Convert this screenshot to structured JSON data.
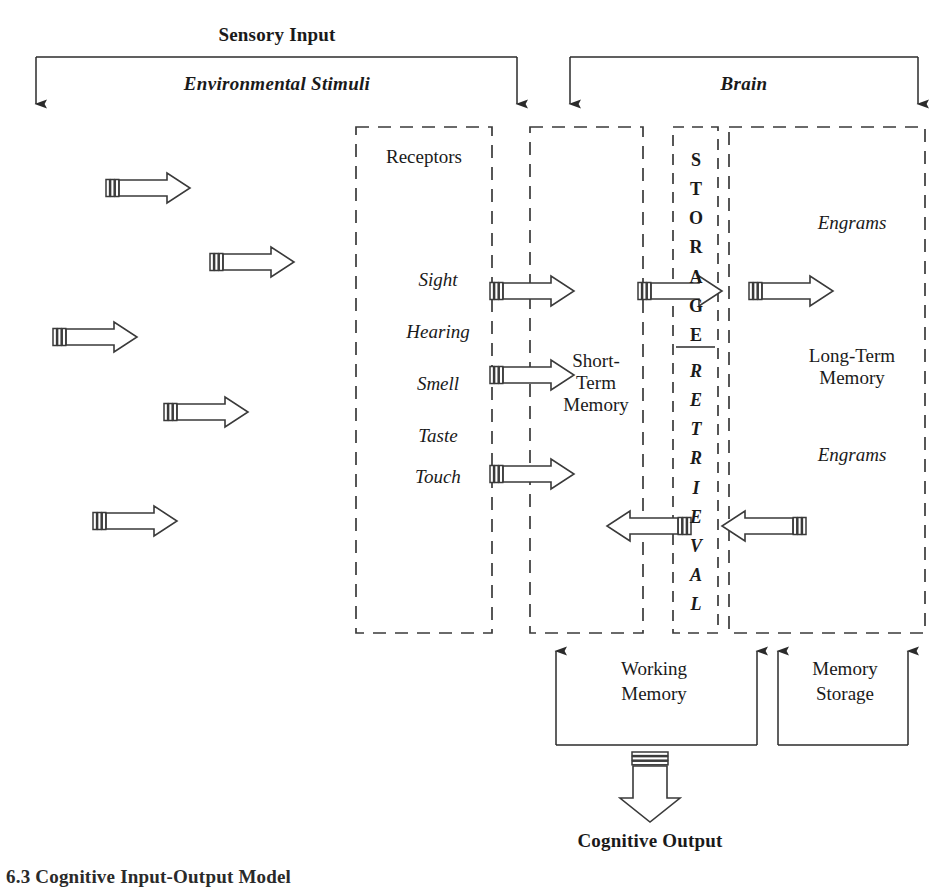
{
  "diagram": {
    "title_top": "Sensory Input",
    "caption": "6.3  Cognitive Input-Output Model",
    "groups": [
      {
        "label": "Environmental Stimuli"
      },
      {
        "label": "Brain"
      }
    ],
    "boxes": {
      "receptors": {
        "title": "Receptors",
        "senses": [
          "Sight",
          "Hearing",
          "Smell",
          "Taste",
          "Touch"
        ]
      },
      "short_term": {
        "line1": "Short-",
        "line2": "Term",
        "line3": "Memory"
      },
      "storage_column": {
        "storage_letters": [
          "S",
          "T",
          "O",
          "R",
          "A",
          "G",
          "E"
        ],
        "retrieval_letters": [
          "R",
          "E",
          "T",
          "R",
          "I",
          "E",
          "V",
          "A",
          "L"
        ],
        "storage_word": "STORAGE",
        "retrieval_word": "RETRIEVAL"
      },
      "long_term": {
        "engrams_top": "Engrams",
        "line1": "Long-Term",
        "line2": "Memory",
        "engrams_bottom": "Engrams"
      }
    },
    "brackets_bottom": [
      {
        "line1": "Working",
        "line2": "Memory"
      },
      {
        "line1": "Memory",
        "line2": "Storage"
      }
    ],
    "output_label": "Cognitive Output",
    "colors": {
      "ink": "#1a1a1a",
      "stroke": "#3a3a3a",
      "background": "#ffffff"
    }
  }
}
